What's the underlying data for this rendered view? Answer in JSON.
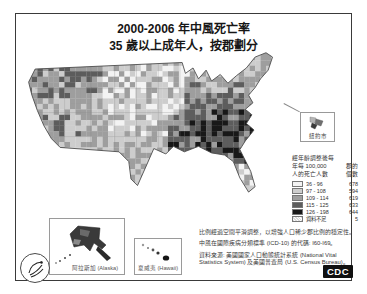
{
  "figure": {
    "title_line1": "2000-2006 年中風死亡率",
    "title_line2": "35 歲以上成年人，按郡劃分"
  },
  "callout": {
    "label": "紐約市"
  },
  "legend": {
    "title_line1": "經年齡調整後每",
    "title_line2": "年每 100,000",
    "title_line3": "人的死亡人數",
    "count_header_line1": "郡的",
    "count_header_line2": "個數",
    "rows": [
      {
        "range": "36 - 96",
        "count": "678",
        "swatch": "#f3f3f3"
      },
      {
        "range": "97 - 108",
        "count": "594",
        "swatch": "#cdcdcd"
      },
      {
        "range": "109 - 114",
        "count": "619",
        "swatch": "#9e9e9e"
      },
      {
        "range": "115 - 125",
        "count": "633",
        "swatch": "#5d5d5d"
      },
      {
        "range": "126 - 198",
        "count": "644",
        "swatch": "#181818"
      },
      {
        "range": "資料不足",
        "count": "5",
        "swatch": "hatch"
      }
    ]
  },
  "insets": {
    "alaska_label": "阿拉斯加 (Alaska)",
    "hawaii_label": "夏威夷 (Hawaii)"
  },
  "footnotes": {
    "line1": "比例經過空間平滑調整，以增強人口稀少郡比例的穩定性。",
    "line2": "中風在國際疾病分類標準 (ICD-10) 的代碼: I60-I69。",
    "line3": "資料來源: 美國國家人口動態統計系統 (National Vital Statistics System) 及美國普查局 (U.S. Census Bureau)。"
  },
  "logos": {
    "cdc_label": "CDC"
  },
  "map": {
    "description": "美國各郡中風死亡率分布圖（灰階五分位，東南部「中風帶」最深色）",
    "shade_colors": [
      "#f3f3f3",
      "#cdcdcd",
      "#9e9e9e",
      "#5d5d5d",
      "#181818"
    ]
  }
}
